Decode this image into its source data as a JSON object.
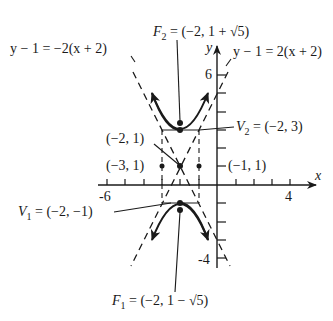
{
  "diagram": {
    "equation_implied": "(y-1)^2/4 - (x+2)^2 = 1",
    "axes": {
      "x_label": "x",
      "y_label": "y",
      "x_ticks": [
        "-6",
        "4"
      ],
      "y_ticks": [
        "6",
        "-4"
      ]
    },
    "labels": {
      "asymptote_left": "y − 1 = −2(x + 2)",
      "asymptote_right": "y − 1 = 2(x + 2)",
      "f2_name": "F",
      "f2_sub": "2",
      "f2_value": " = (−2, 1 + √5)",
      "f1_name": "F",
      "f1_sub": "1",
      "f1_value": " = (−2, 1 − √5)",
      "v2_name": "V",
      "v2_sub": "2",
      "v2_value": " = (−2, 3)",
      "v1_name": "V",
      "v1_sub": "1",
      "v1_value": " = (−2, −1)",
      "center": "(−2, 1)",
      "left_point": "(−3, 1)",
      "right_point": "(−1, 1)"
    },
    "points": {
      "center": [
        -2,
        1
      ],
      "V1": [
        -2,
        -1
      ],
      "V2": [
        -2,
        3
      ],
      "F1": [
        -2,
        -1.236
      ],
      "F2": [
        -2,
        3.236
      ],
      "P_left": [
        -3,
        1
      ],
      "P_right": [
        -1,
        1
      ]
    },
    "colors": {
      "ink": "#1a1a1a",
      "background": "#ffffff"
    }
  }
}
